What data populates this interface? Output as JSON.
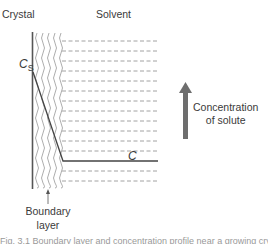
{
  "diagram": {
    "regions": {
      "crystal_label": "Crystal",
      "solvent_label": "Solvent"
    },
    "concentration_labels": {
      "surface": "C",
      "surface_subscript": "S",
      "bulk": "C"
    },
    "boundary_layer_label": [
      "Boundary",
      "layer"
    ],
    "axis_arrow_label": [
      "Concentration",
      "of solute"
    ],
    "colors": {
      "wall": "#555555",
      "curve": "#444444",
      "dashes": "#8a8a8a",
      "wavy": "#8a8a8a",
      "arrow": "#6e6e6e"
    },
    "dashed_rows": 11,
    "caption_partial": "Fig. 3.1  Boundary layer and concentration profile near a growing crystal face"
  }
}
